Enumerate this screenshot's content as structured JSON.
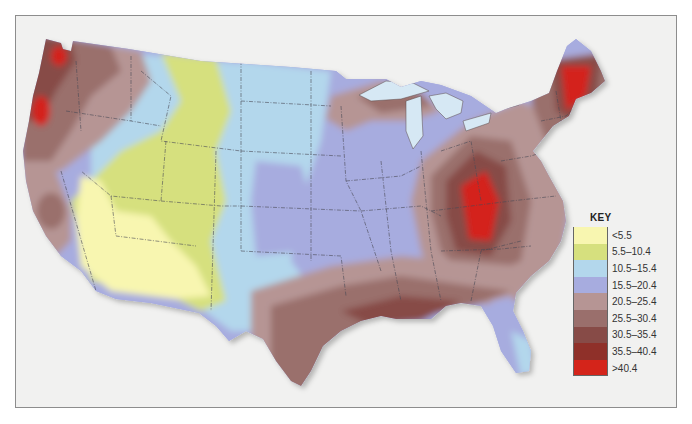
{
  "map": {
    "title": "",
    "subject": "Contiguous United States choropleth map",
    "region": "Contiguous United States"
  },
  "key": {
    "title": "KEY",
    "items": [
      {
        "label": "<5.5",
        "color": "#f8f6b0"
      },
      {
        "label": "5.5–10.4",
        "color": "#d6e07e"
      },
      {
        "label": "10.5–15.4",
        "color": "#b3d7ec"
      },
      {
        "label": "15.5–20.4",
        "color": "#a7acdf"
      },
      {
        "label": "20.5–25.4",
        "color": "#b69594"
      },
      {
        "label": "25.5–30.4",
        "color": "#9a6f6c"
      },
      {
        "label": "30.5–35.4",
        "color": "#874b47"
      },
      {
        "label": "35.5–40.4",
        "color": "#8f3029"
      },
      {
        "label": ">40.4",
        "color": "#d4241a"
      }
    ]
  },
  "colors": {
    "background": "#f1f1f0",
    "water": "#d6e8f4",
    "state_border": "#4a4a55",
    "frame_border": "#8d8d8d"
  }
}
